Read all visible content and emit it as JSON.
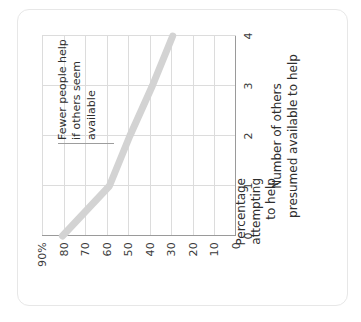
{
  "figure": {
    "card_label": "figure-card"
  },
  "chart_data": {
    "type": "line",
    "title": "",
    "subtitle": "",
    "xlabel": "Number of others presumed available to help",
    "ylabel": "Percentage attempting to help",
    "ylabel_lines": [
      "Percentage",
      "attempting",
      "to help"
    ],
    "xlabel_lines": [
      "Number of others",
      "presumed available to help"
    ],
    "x": [
      0,
      1,
      2,
      3,
      4
    ],
    "xtick_labels": [
      "0",
      "1",
      "2",
      "3",
      "4"
    ],
    "ytick_labels": [
      "0",
      "10",
      "20",
      "30",
      "40",
      "50",
      "60",
      "70",
      "80",
      "90%"
    ],
    "ytick_values": [
      0,
      10,
      20,
      30,
      40,
      50,
      60,
      70,
      80,
      90
    ],
    "xlim": [
      0,
      4
    ],
    "ylim": [
      0,
      95
    ],
    "grid": "both",
    "legend": "none",
    "series": [
      {
        "name": "Percentage attempting to help",
        "values": [
          85,
          62,
          52,
          41,
          31
        ],
        "color": "#d3d3d3",
        "line_width": 7
      }
    ],
    "annotations": [
      {
        "text": "Fewer people help if others seem available",
        "lines": [
          "Fewer people help",
          "if others seem",
          "available"
        ],
        "leader": "vertical-line"
      }
    ]
  },
  "ticks": {
    "y": [
      {
        "label": "90%",
        "value": 90
      },
      {
        "label": "80",
        "value": 80
      },
      {
        "label": "70",
        "value": 70
      },
      {
        "label": "60",
        "value": 60
      },
      {
        "label": "50",
        "value": 50
      },
      {
        "label": "40",
        "value": 40
      },
      {
        "label": "30",
        "value": 30
      },
      {
        "label": "20",
        "value": 20
      },
      {
        "label": "10",
        "value": 10
      },
      {
        "label": "0",
        "value": 0
      }
    ],
    "x": [
      {
        "label": "0",
        "value": 0
      },
      {
        "label": "1",
        "value": 1
      },
      {
        "label": "2",
        "value": 2
      },
      {
        "label": "3",
        "value": 3
      },
      {
        "label": "4",
        "value": 4
      }
    ]
  },
  "annotation": {
    "line1": "Fewer people help",
    "line2": "if others seem",
    "line3": "available"
  },
  "axis_titles": {
    "y_line1": "Percentage",
    "y_line2": "attempting",
    "y_line3": "to help",
    "x_line1": "Number of others",
    "x_line2": "presumed available to help"
  },
  "colors": {
    "data_line": "#d3d3d3",
    "grid": "#dcdcdc",
    "axis": "#9a9a9a",
    "text": "#2e2e2e",
    "card_border": "#e7e7e7",
    "background": "#ffffff"
  }
}
